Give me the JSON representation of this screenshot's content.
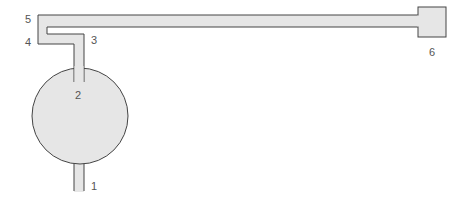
{
  "diagram": {
    "type": "pipe-flow-schematic",
    "colors": {
      "fill": "#e6e6e6",
      "stroke": "#444444",
      "label": "#555555",
      "background": "#ffffff"
    },
    "components": {
      "tank": {
        "shape": "circle",
        "cx": 80,
        "cy": 116,
        "r": 48
      },
      "end_box": {
        "shape": "rect",
        "x": 418,
        "y": 7,
        "width": 28,
        "height": 30
      }
    },
    "points": [
      {
        "id": "1",
        "label": "1",
        "x": 91,
        "y": 181
      },
      {
        "id": "2",
        "label": "2",
        "x": 75,
        "y": 90
      },
      {
        "id": "3",
        "label": "3",
        "x": 91,
        "y": 35
      },
      {
        "id": "4",
        "label": "4",
        "x": 25,
        "y": 37
      },
      {
        "id": "5",
        "label": "5",
        "x": 25,
        "y": 14
      },
      {
        "id": "6",
        "label": "6",
        "x": 429,
        "y": 47
      }
    ]
  }
}
